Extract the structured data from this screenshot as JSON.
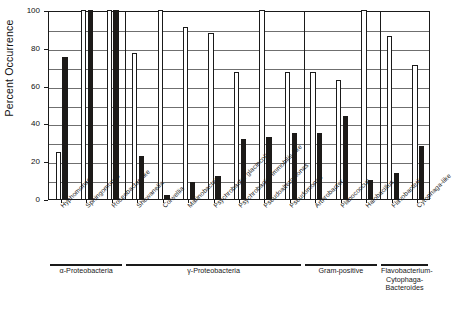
{
  "chart_data": {
    "type": "bar",
    "title": "",
    "xlabel": "",
    "ylabel": "Percent Occurrence",
    "ylim": [
      0,
      100
    ],
    "yticks": [
      0,
      20,
      40,
      60,
      80,
      100
    ],
    "ytick_labels": [
      "0",
      "20",
      "40",
      "60",
      "80",
      "100"
    ],
    "grid": true,
    "legend_position": "none",
    "categories": [
      "Hyphomonas",
      "Sphingomonas",
      "Roseobacter-like",
      "Shewanella",
      "Colwellia",
      "Marinobacter",
      "Psychrobacter glacincola",
      "Psychrobacter immobilis-like",
      "Pseudoalteromonas",
      "Pseudomonas",
      "Arthrobacter",
      "Planococcus",
      "Halobacillus",
      "Flavobacteria",
      "Cytophaga-like"
    ],
    "series": [
      {
        "name": "open",
        "fill": "#ffffff",
        "values": [
          25,
          100,
          100,
          77,
          100,
          91,
          88,
          67,
          100,
          67,
          67,
          63,
          100,
          86,
          71
        ]
      },
      {
        "name": "filled",
        "fill": "#1c1a18",
        "values": [
          75,
          100,
          100,
          23,
          2,
          9,
          12,
          32,
          33,
          35,
          35,
          44,
          10,
          14,
          28
        ]
      }
    ],
    "groups": [
      {
        "label": "α-Proteobacteria",
        "start": 0,
        "end": 2
      },
      {
        "label": "γ-Proteobacteria",
        "start": 3,
        "end": 9
      },
      {
        "label": "Gram-positive",
        "start": 10,
        "end": 12
      },
      {
        "label": "Flavobacterium-\nCytophaga-Bacteroides",
        "start": 13,
        "end": 14
      }
    ]
  },
  "colors": {
    "axis": "#1a1a1a",
    "grid": "#6f6f6f",
    "bar_open": "#ffffff",
    "bar_filled": "#1c1a18",
    "background": "#ffffff"
  }
}
